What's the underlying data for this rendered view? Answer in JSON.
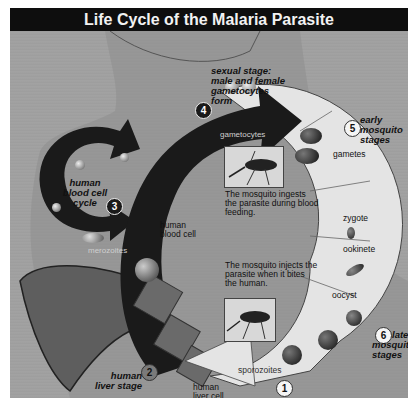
{
  "title": "Life Cycle of the Malaria Parasite",
  "stages": [
    {
      "number": "1",
      "label": "sporozoites"
    },
    {
      "number": "2",
      "label": "human liver stage"
    },
    {
      "number": "3",
      "label": "human blood cell cycle"
    },
    {
      "number": "4",
      "label": "sexual stage: male and female gametocytes form"
    },
    {
      "number": "5",
      "label": "early mosquito stages"
    },
    {
      "number": "6",
      "label": "late mosquito stages"
    }
  ],
  "stage_text": {
    "s2_line1": "human",
    "s2_line2": "liver stage",
    "s3_line1": "human",
    "s3_line2": "blood cell",
    "s3_line3": "cycle",
    "s4_line1": "sexual stage:",
    "s4_line2": "male and female",
    "s4_line3": "gametocytes",
    "s4_line4": "form",
    "s5_line1": "early",
    "s5_line2": "mosquito",
    "s5_line3": "stages",
    "s6_line1": "late",
    "s6_line2": "mosquito",
    "s6_line3": "stages"
  },
  "labels": {
    "gametocytes": "gametocytes",
    "merozoites": "merozoites",
    "sporozoites": "sporozoites",
    "human_blood_cell_1": "human",
    "human_blood_cell_2": "blood cell",
    "human_liver_cell_1": "human",
    "human_liver_cell_2": "liver cell",
    "gametes": "gametes",
    "zygote": "zygote",
    "ookinete": "ookinete",
    "oocyst": "oocyst"
  },
  "captions": {
    "ingest_1": "The mosquito ingests",
    "ingest_2": "the parasite during blood",
    "ingest_3": "feeding.",
    "inject_1": "The mosquito injects the",
    "inject_2": "parasite when it bites",
    "inject_3": "the human."
  },
  "colors": {
    "title_bar": "#0e0e0e",
    "arrow": "#1a1a1a",
    "mosquito_ring": "#e6e6e6",
    "background": "#9f9f9f"
  }
}
